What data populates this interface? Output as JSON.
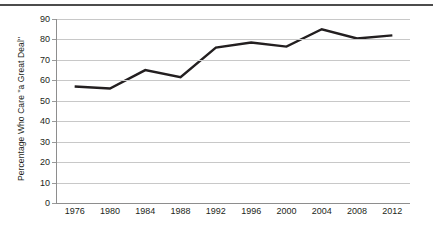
{
  "chart_data": {
    "type": "line",
    "title": "",
    "xlabel": "",
    "ylabel": "Percentage Who Care \"a Great Deal\"",
    "categories": [
      "1976",
      "1980",
      "1984",
      "1988",
      "1992",
      "1996",
      "2000",
      "2004",
      "2008",
      "2012"
    ],
    "x": [
      1976,
      1980,
      1984,
      1988,
      1992,
      1996,
      2000,
      2004,
      2008,
      2012
    ],
    "values": [
      57,
      56,
      65,
      61.5,
      76,
      78.5,
      76.5,
      85,
      80.5,
      82
    ],
    "series": [
      {
        "name": "Percentage Who Care \"a Great Deal\"",
        "values": [
          57,
          56,
          65,
          61.5,
          76,
          78.5,
          76.5,
          85,
          80.5,
          82
        ]
      }
    ],
    "ylim": [
      0,
      90
    ],
    "yticks": [
      0,
      10,
      20,
      30,
      40,
      50,
      60,
      70,
      80,
      90
    ],
    "ytick_labels": [
      "0",
      "10",
      "20",
      "30",
      "40",
      "50",
      "60",
      "70",
      "80",
      "90"
    ],
    "xtick_labels": [
      "1976",
      "1980",
      "1984",
      "1988",
      "1992",
      "1996",
      "2000",
      "2004",
      "2008",
      "2012"
    ],
    "grid": true,
    "grid_axis": "y",
    "legend": false,
    "legend_position": "none",
    "markers": false,
    "line_color": "#231f20",
    "line_width": 2.4,
    "grid_color": "#c8c8c8",
    "axis_color": "#8e8e8e",
    "background_color": "#ffffff"
  }
}
